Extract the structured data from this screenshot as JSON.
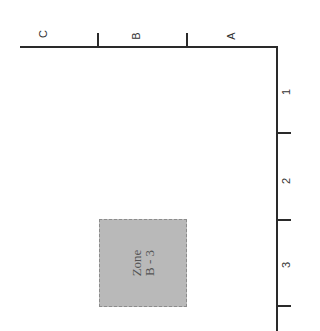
{
  "diagram": {
    "columns": [
      {
        "label": "C"
      },
      {
        "label": "B"
      },
      {
        "label": "A"
      }
    ],
    "rows": [
      {
        "label": "1"
      },
      {
        "label": "2"
      },
      {
        "label": "3"
      }
    ],
    "zone": {
      "line1": "Zone",
      "line2": "B - 3",
      "fill_color": "#b9b9b9"
    },
    "line_color": "#2a2a2a"
  }
}
